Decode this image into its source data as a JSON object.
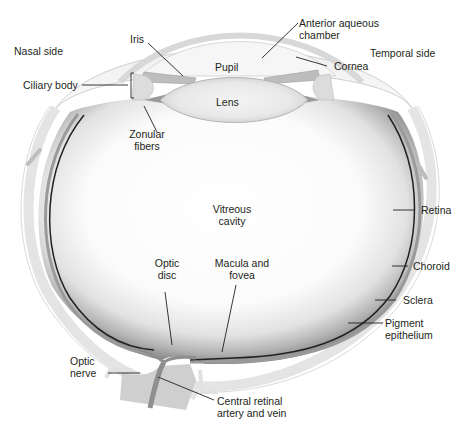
{
  "diagram": {
    "colors": {
      "background": "#ffffff",
      "outline": "#231f20",
      "sclera": "#e6e6e6",
      "tissue_gray": "#c8c8c8",
      "dark_gray": "#8a8a8a",
      "vitreous_center": "#ffffff",
      "vitreous_edge": "#9a9a9a",
      "optic_nerve": "#cfcfcf",
      "vessel": "#8f8f8f"
    },
    "side_labels": {
      "nasal": "Nasal side",
      "temporal": "Temporal side"
    },
    "labels": {
      "iris": "Iris",
      "anterior_chamber": [
        "Anterior aqueous",
        "chamber"
      ],
      "pupil": "Pupil",
      "cornea": "Cornea",
      "ciliary_body": "Ciliary body",
      "lens": "Lens",
      "zonular_fibers": [
        "Zonular",
        "fibers"
      ],
      "vitreous_cavity": [
        "Vitreous",
        "cavity"
      ],
      "retina": "Retina",
      "optic_disc": [
        "Optic",
        "disc"
      ],
      "macula_fovea": [
        "Macula and",
        "fovea"
      ],
      "choroid": "Choroid",
      "sclera": "Sclera",
      "pigment_epithelium": [
        "Pigment",
        "epithelium"
      ],
      "optic_nerve": [
        "Optic",
        "nerve"
      ],
      "central_retinal": [
        "Central retinal",
        "artery and vein"
      ]
    }
  }
}
